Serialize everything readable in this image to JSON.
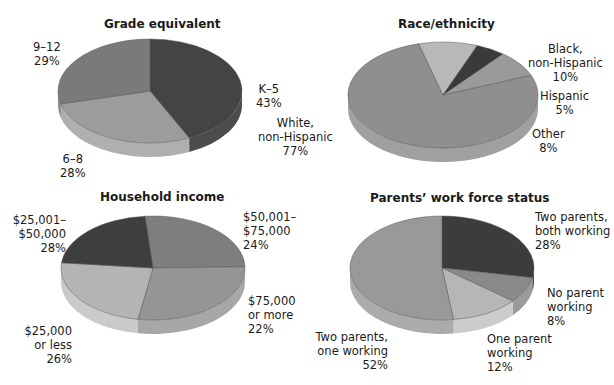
{
  "chart_data": [
    {
      "type": "pie",
      "title": "Grade equivalent",
      "categories": [
        "K–5",
        "6–8",
        "9–12"
      ],
      "values": [
        43,
        28,
        29
      ],
      "labels": [
        "K–5\n43%",
        "6–8\n28%",
        "9–12\n29%"
      ],
      "colors": [
        "#444444",
        "#9c9c9c",
        "#7a7a7a"
      ]
    },
    {
      "type": "pie",
      "title": "Race/ethnicity",
      "categories": [
        "White, non-Hispanic",
        "Black, non-Hispanic",
        "Hispanic",
        "Other"
      ],
      "values": [
        77,
        10,
        5,
        8
      ],
      "labels": [
        "White,\nnon-Hispanic\n77%",
        "Black,\nnon-Hispanic\n10%",
        "Hispanic\n5%",
        "Other\n8%"
      ],
      "colors": [
        "#8f8f8f",
        "#b8b8b8",
        "#3a3a3a",
        "#9a9a9a"
      ]
    },
    {
      "type": "pie",
      "title": "Household income",
      "categories": [
        "$25,000 or less",
        "$25,001–$50,000",
        "$50,001–$75,000",
        "$75,000 or more"
      ],
      "values": [
        26,
        28,
        24,
        22
      ],
      "labels": [
        "$25,000\nor less\n26%",
        "$25,001–\n$50,000\n28%",
        "$50,001–\n$75,000\n24%",
        "$75,000\nor more\n22%"
      ],
      "colors": [
        "#7e7e7e",
        "#959595",
        "#b4b4b4",
        "#3e3e3e"
      ]
    },
    {
      "type": "pie",
      "title": "Parents’ work force status",
      "categories": [
        "Two parents, both working",
        "No parent working",
        "One parent working",
        "Two parents, one working"
      ],
      "values": [
        28,
        8,
        12,
        52
      ],
      "labels": [
        "Two parents,\nboth working\n28%",
        "No parent\nworking\n8%",
        "One parent\nworking\n12%",
        "Two parents,\none working\n52%"
      ],
      "colors": [
        "#3c3c3c",
        "#8a8a8a",
        "#b6b6b6",
        "#999999"
      ]
    }
  ]
}
